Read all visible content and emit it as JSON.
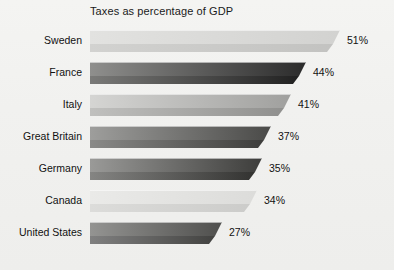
{
  "chart_data": {
    "type": "bar",
    "orientation": "horizontal",
    "title": "Taxes as percentage of GDP",
    "xlabel": "",
    "ylabel": "",
    "xlim": [
      0,
      55
    ],
    "grid": false,
    "legend": false,
    "value_suffix": "%",
    "categories": [
      "Sweden",
      "France",
      "Italy",
      "Great Britain",
      "Germany",
      "Canada",
      "United States"
    ],
    "values": [
      51,
      44,
      41,
      37,
      35,
      34,
      27
    ],
    "value_labels": [
      "51%",
      "44%",
      "41%",
      "37%",
      "35%",
      "34%",
      "27%"
    ],
    "bars": [
      {
        "category": "Sweden",
        "value": 51,
        "label": "51%",
        "face_from": "#e2e2e0",
        "face_to": "#d2d2d0",
        "base_from": "#d2d2d0",
        "base_to": "#c2c2c0"
      },
      {
        "category": "France",
        "value": 44,
        "label": "44%",
        "face_from": "#8f8f8d",
        "face_to": "#2b2b2b",
        "base_from": "#7a7a78",
        "base_to": "#1e1e1e"
      },
      {
        "category": "Italy",
        "value": 41,
        "label": "41%",
        "face_from": "#d5d5d3",
        "face_to": "#a0a09e",
        "base_from": "#c0c0be",
        "base_to": "#8e8e8c"
      },
      {
        "category": "Great Britain",
        "value": 37,
        "label": "37%",
        "face_from": "#9e9e9c",
        "face_to": "#4a4a48",
        "base_from": "#8a8a88",
        "base_to": "#3a3a38"
      },
      {
        "category": "Germany",
        "value": 35,
        "label": "35%",
        "face_from": "#9a9a98",
        "face_to": "#3d3d3b",
        "base_from": "#858583",
        "base_to": "#2f2f2d"
      },
      {
        "category": "Canada",
        "value": 34,
        "label": "34%",
        "face_from": "#eaeae8",
        "face_to": "#dcdcda",
        "base_from": "#dcdcda",
        "base_to": "#cbcbc9"
      },
      {
        "category": "United States",
        "value": 27,
        "label": "27%",
        "face_from": "#949492",
        "face_to": "#4f4f4d",
        "base_from": "#808080",
        "base_to": "#3f3f3d"
      }
    ],
    "background_color": "#f2f2f0",
    "text_color": "#111111"
  },
  "layout": {
    "bar_origin_x": 90,
    "px_per_unit": 4.9,
    "row_height": 32,
    "first_row_top": 4,
    "label_gap": 7
  }
}
